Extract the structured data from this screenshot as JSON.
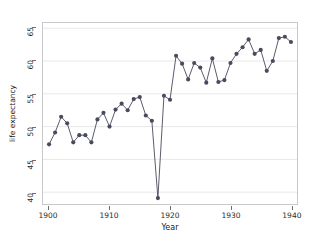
{
  "chart_data": {
    "type": "line",
    "title": "",
    "xlabel": "Year",
    "ylabel": "life expectancy",
    "xlim": [
      1899,
      1941
    ],
    "ylim": [
      38.2,
      65.8
    ],
    "xticks": [
      1900,
      1910,
      1920,
      1930,
      1940
    ],
    "yticks": [
      40,
      45,
      50,
      55,
      60,
      65
    ],
    "grid": "horizontal",
    "legend": "none",
    "marker": "filled-circle",
    "series_color": "#4a4a5e",
    "grid_color": "#e8e8ec",
    "axis_color": "#6f6f72",
    "background": "#ffffff",
    "x": [
      1900,
      1901,
      1902,
      1903,
      1904,
      1905,
      1906,
      1907,
      1908,
      1909,
      1910,
      1911,
      1912,
      1913,
      1914,
      1915,
      1916,
      1917,
      1918,
      1919,
      1920,
      1921,
      1922,
      1923,
      1924,
      1925,
      1926,
      1927,
      1928,
      1929,
      1930,
      1931,
      1932,
      1933,
      1934,
      1935,
      1936,
      1937,
      1938,
      1939,
      1940
    ],
    "values": [
      47.3,
      49.1,
      51.5,
      50.5,
      47.6,
      48.7,
      48.7,
      47.6,
      51.1,
      52.1,
      50.0,
      52.6,
      53.5,
      52.5,
      54.2,
      54.5,
      51.7,
      50.9,
      39.1,
      54.7,
      54.1,
      60.8,
      59.6,
      57.2,
      59.7,
      59.0,
      56.7,
      60.4,
      56.8,
      57.1,
      59.7,
      61.1,
      62.1,
      63.3,
      61.1,
      61.7,
      58.5,
      60.0,
      63.5,
      63.7,
      62.9
    ],
    "series_name": "life expectancy",
    "annotations": [
      {
        "x": 1918,
        "y": 39.1,
        "note": "1918 influenza pandemic minimum"
      }
    ]
  },
  "axis": {
    "x_title": "Year",
    "y_title": "life expectancy",
    "x_tick_labels": [
      "1900",
      "1910",
      "1920",
      "1930",
      "1940"
    ],
    "y_tick_labels": [
      "40",
      "45",
      "50",
      "55",
      "60",
      "65"
    ]
  }
}
